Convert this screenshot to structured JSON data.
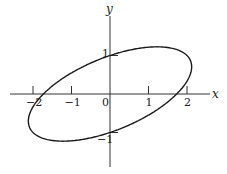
{
  "figure": {
    "x_axis_label": "x",
    "y_axis_label": "y",
    "x_ticks": [
      {
        "value": -2,
        "label": "−2"
      },
      {
        "value": -1,
        "label": "−1"
      },
      {
        "value": 1,
        "label": "1"
      },
      {
        "value": 2,
        "label": "2"
      }
    ],
    "y_ticks": [
      {
        "value": 1,
        "label": "1"
      },
      {
        "value": -1,
        "label": "−1"
      }
    ],
    "origin_label": "0",
    "curve": {
      "description": "ellipse x^2 - 2xy + 3y^2 = 3",
      "A": 1,
      "B": -2,
      "C": 3,
      "F": 3
    },
    "colors": {
      "stroke": "#1a1a1a",
      "axis": "#333333"
    }
  }
}
